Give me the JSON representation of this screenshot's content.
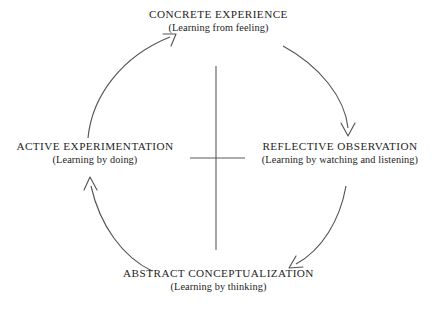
{
  "diagram": {
    "name": "kolb-experiential-learning-cycle",
    "background_color": "#ffffff",
    "stroke_color": "#555555",
    "text_color": "#1e1e1e",
    "nodes": {
      "concrete_experience": {
        "title": "CONCRETE EXPERIENCE",
        "subtitle": "(Learning from feeling)"
      },
      "active_experimentation": {
        "title": "ACTIVE EXPERIMENTATION",
        "subtitle": "(Learning by doing)"
      },
      "reflective_observation": {
        "title": "REFLECTIVE OBSERVATION",
        "subtitle": "(Learning by watching and listening)"
      },
      "abstract_conceptualization": {
        "title": "ABSTRACT CONCEPTUALIZATION",
        "subtitle": "(Learning by thinking)"
      }
    },
    "arrows": [
      {
        "name": "arrow-active-to-concrete",
        "from": "active_experimentation",
        "to": "concrete_experience",
        "direction": "up-right"
      },
      {
        "name": "arrow-concrete-to-reflective",
        "from": "concrete_experience",
        "to": "reflective_observation",
        "direction": "down"
      },
      {
        "name": "arrow-reflective-to-abstract",
        "from": "reflective_observation",
        "to": "abstract_conceptualization",
        "direction": "down-left"
      },
      {
        "name": "arrow-abstract-to-active",
        "from": "abstract_conceptualization",
        "to": "active_experimentation",
        "direction": "up"
      }
    ],
    "axes": {
      "name": "center-cross",
      "vertical": {
        "x": 216,
        "y1": 66,
        "y2": 250
      },
      "horizontal": {
        "y": 158,
        "x1": 190,
        "x2": 245
      }
    }
  }
}
